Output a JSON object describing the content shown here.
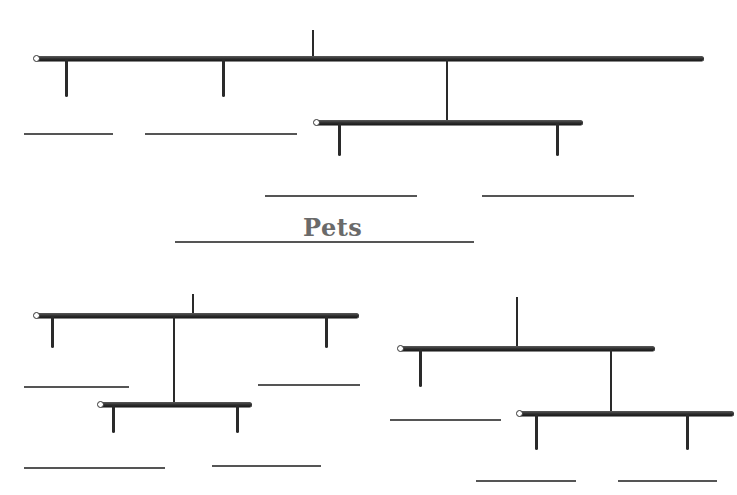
{
  "title": "Pets",
  "diagram": {
    "type": "hanging-mobile-worksheet",
    "mobiles": [
      {
        "name": "top-mobile",
        "rods": 2,
        "answer_blanks": 4
      },
      {
        "name": "bottom-left-mobile",
        "rods": 2,
        "answer_blanks": 4
      },
      {
        "name": "bottom-right-mobile",
        "rods": 2,
        "answer_blanks": 4
      }
    ],
    "title_blank": true
  },
  "colors": {
    "rod": "#2b2b2b",
    "line": "#555555",
    "title": "#6a6a6a"
  }
}
